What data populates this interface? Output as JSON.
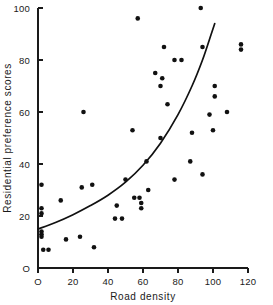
{
  "chart_data": {
    "type": "scatter",
    "title": "",
    "xlabel": "Road density",
    "ylabel": "Residential preference scores",
    "xlim": [
      0,
      120
    ],
    "ylim": [
      0,
      100
    ],
    "xticks": [
      0,
      20,
      40,
      60,
      80,
      100,
      120
    ],
    "xticklabels": [
      "O",
      "20",
      "40",
      "60",
      "80",
      "100",
      "120"
    ],
    "yticks": [
      0,
      20,
      40,
      60,
      80,
      100
    ],
    "yticklabels": [
      "O",
      "20",
      "40",
      "60",
      "80",
      "100"
    ],
    "grid": false,
    "legend": null,
    "marker": "filled-circle",
    "points": [
      [
        2,
        32
      ],
      [
        2,
        23
      ],
      [
        2,
        21
      ],
      [
        2,
        14
      ],
      [
        2,
        13
      ],
      [
        2,
        12
      ],
      [
        3,
        7
      ],
      [
        6,
        7
      ],
      [
        13,
        26
      ],
      [
        16,
        11
      ],
      [
        24,
        12
      ],
      [
        25,
        31
      ],
      [
        26,
        60
      ],
      [
        31,
        32
      ],
      [
        32,
        8
      ],
      [
        44,
        19
      ],
      [
        45,
        24
      ],
      [
        48,
        19
      ],
      [
        50,
        34
      ],
      [
        54,
        53
      ],
      [
        55,
        27
      ],
      [
        57,
        96
      ],
      [
        58,
        27
      ],
      [
        59,
        25
      ],
      [
        59,
        23
      ],
      [
        62,
        41
      ],
      [
        63,
        30
      ],
      [
        67,
        75
      ],
      [
        70,
        70
      ],
      [
        70,
        50
      ],
      [
        71,
        73
      ],
      [
        72,
        85
      ],
      [
        74,
        63
      ],
      [
        78,
        80
      ],
      [
        78,
        34
      ],
      [
        82,
        80
      ],
      [
        87,
        41
      ],
      [
        88,
        52
      ],
      [
        93,
        100
      ],
      [
        94,
        85
      ],
      [
        94,
        36
      ],
      [
        98,
        59
      ],
      [
        100,
        53
      ],
      [
        101,
        70
      ],
      [
        101,
        66
      ],
      [
        108,
        60
      ],
      [
        116,
        86
      ],
      [
        116,
        84
      ]
    ],
    "fit_curve": {
      "description": "exponential regression line",
      "points": [
        [
          0,
          15
        ],
        [
          10,
          17.5
        ],
        [
          20,
          20.5
        ],
        [
          30,
          24
        ],
        [
          40,
          28
        ],
        [
          50,
          33
        ],
        [
          60,
          39.5
        ],
        [
          70,
          48
        ],
        [
          80,
          59
        ],
        [
          88,
          70
        ],
        [
          94,
          80
        ],
        [
          99,
          90
        ],
        [
          101,
          94
        ]
      ]
    }
  }
}
